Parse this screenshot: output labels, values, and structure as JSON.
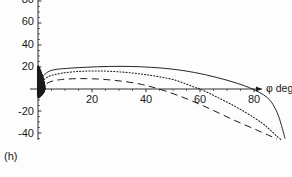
{
  "figure": {
    "panel_label": "(h)",
    "background_color": "#fdfdfd",
    "ink_color": "#1a1a1a"
  },
  "axes": {
    "x_axis_title": "φ deg",
    "y_axis_title": "",
    "x_ticks": [
      {
        "value": 20,
        "label": "20",
        "px": 92
      },
      {
        "value": 40,
        "label": "40",
        "px": 146
      },
      {
        "value": 60,
        "label": "60",
        "px": 200
      },
      {
        "value": 80,
        "label": "80",
        "px": 254
      }
    ],
    "y_ticks": [
      {
        "value": 80,
        "label": "80",
        "px": 0
      },
      {
        "value": 60,
        "label": "60",
        "px": 22
      },
      {
        "value": 40,
        "label": "40",
        "px": 45
      },
      {
        "value": 20,
        "label": "20",
        "px": 67
      },
      {
        "value": -20,
        "label": "-20",
        "px": 112
      },
      {
        "value": -40,
        "label": "-40",
        "px": 134
      }
    ]
  },
  "chart_data": {
    "type": "line",
    "title": "",
    "subtitle": "",
    "panel": "(h)",
    "xlabel": "φ deg",
    "ylabel": "",
    "xlim": [
      -3,
      95
    ],
    "ylim": [
      -48,
      82
    ],
    "grid": false,
    "legend": "none",
    "x_ticks": [
      20,
      40,
      60,
      80
    ],
    "y_ticks": [
      80,
      60,
      40,
      20,
      -20,
      -40
    ],
    "series": [
      {
        "name": "curve-solid",
        "style": "solid",
        "color": "#1a1a1a",
        "x": [
          0,
          2,
          4,
          6,
          8,
          10,
          14,
          18,
          22,
          26,
          30,
          34,
          38,
          42,
          46,
          50,
          54,
          58,
          62,
          66,
          70,
          74,
          78,
          82,
          85,
          87,
          89,
          90.5,
          91.5
        ],
        "y": [
          4,
          12,
          16,
          17.5,
          18.2,
          18.6,
          19.3,
          19.8,
          20.2,
          20.5,
          20.6,
          20.5,
          20.2,
          19.7,
          19.0,
          18.0,
          16.7,
          15.0,
          13.0,
          10.6,
          8.0,
          5.0,
          1.5,
          -3.0,
          -8.0,
          -14.0,
          -24.0,
          -36.0,
          -45.0
        ]
      },
      {
        "name": "curve-dotted",
        "style": "dotted",
        "color": "#1a1a1a",
        "x": [
          0,
          2,
          4,
          6,
          8,
          10,
          14,
          18,
          22,
          26,
          30,
          34,
          38,
          42,
          46,
          50,
          54,
          58,
          60,
          64,
          68,
          72,
          76,
          80,
          83,
          85,
          87,
          88.5,
          90
        ],
        "y": [
          2,
          8,
          11.5,
          13.0,
          14.0,
          14.8,
          15.8,
          16.3,
          16.4,
          16.2,
          15.6,
          14.8,
          13.7,
          12.3,
          10.6,
          8.6,
          5.4,
          1.6,
          0.0,
          -4.5,
          -9.5,
          -14.5,
          -20.0,
          -26.0,
          -31.0,
          -35.0,
          -39.5,
          -43.0,
          -46.0
        ]
      },
      {
        "name": "curve-long-dashed",
        "style": "long-dashed",
        "color": "#1a1a1a",
        "x": [
          0,
          2,
          4,
          6,
          8,
          10,
          14,
          18,
          22,
          26,
          30,
          34,
          38,
          41,
          44,
          48,
          52,
          56,
          60,
          64,
          68,
          72,
          76,
          80,
          83,
          85,
          87,
          88.5
        ],
        "y": [
          -2,
          3,
          6.0,
          7.6,
          8.4,
          8.9,
          9.4,
          9.4,
          9.1,
          8.4,
          7.4,
          6.1,
          4.4,
          2.6,
          0.6,
          -2.5,
          -6.0,
          -9.8,
          -14.0,
          -18.4,
          -23.0,
          -27.6,
          -32.0,
          -36.2,
          -39.5,
          -41.6,
          -43.8,
          -45.5
        ]
      }
    ],
    "oscillation": {
      "description": "dense near-axis oscillation at small φ",
      "x_range": [
        0,
        2.6
      ],
      "y_range": [
        -9,
        22
      ]
    }
  }
}
